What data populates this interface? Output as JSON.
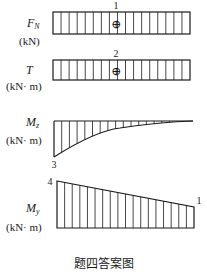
{
  "diagrams": {
    "fn": {
      "symbol": "F",
      "subscript": "N",
      "unit": "(kN)",
      "value_label": "1",
      "sign": "⊕"
    },
    "t": {
      "symbol": "T",
      "subscript": "",
      "unit": "(kN· m)",
      "value_label": "2",
      "sign": "⊕"
    },
    "mz": {
      "symbol": "M",
      "subscript": "z",
      "unit": "(kN· m)",
      "value_label": "3"
    },
    "my": {
      "symbol": "M",
      "subscript": "y",
      "unit": "(kN· m)",
      "value_label_left": "4",
      "value_label_right": "1"
    }
  },
  "caption": "题四答案图"
}
